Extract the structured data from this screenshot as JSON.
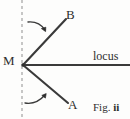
{
  "figure": {
    "caption": "Fig.",
    "caption_number": "ii",
    "background_color": "#fdfdfc",
    "stroke_color": "#3a3a3a",
    "dashed_line_color": "#8a8a8a",
    "labels": {
      "vertex": "M",
      "ray_upper_end": "B",
      "ray_lower_end": "A",
      "horizontal_line": "locus"
    },
    "geometry": {
      "vertex_point": [
        23,
        65
      ],
      "upper_ray_end": [
        66,
        19
      ],
      "lower_ray_end": [
        68,
        103
      ],
      "locus_line_start": [
        23,
        65
      ],
      "locus_line_end": [
        129,
        65
      ],
      "dashed_vertical_x": 22,
      "dashed_vertical_top": 0,
      "dashed_vertical_bottom": 119
    },
    "arrows": [
      {
        "name": "upper-rotation-arrow",
        "direction": "clockwise-down-right",
        "start": [
          28,
          22
        ],
        "end": [
          46,
          32
        ]
      },
      {
        "name": "lower-rotation-arrow",
        "direction": "counterclockwise-up-right",
        "start": [
          25,
          104
        ],
        "end": [
          46,
          93
        ]
      }
    ]
  }
}
